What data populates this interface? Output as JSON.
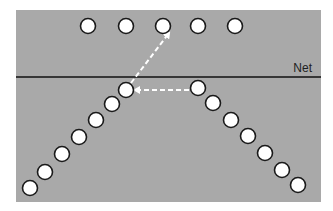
{
  "diagram": {
    "net_label": "Net",
    "colors": {
      "court": "#a9a9a9",
      "background": "#ffffff",
      "net_line": "#111111",
      "player_fill": "#ffffff",
      "player_stroke": "#1a1a1a",
      "arrow": "#ffffff"
    },
    "court": {
      "x": 16,
      "y": 10,
      "width": 305,
      "height": 192
    },
    "net": {
      "y": 77,
      "x1": 16,
      "x2": 321
    },
    "player_radius": 7.5,
    "players": {
      "far_side_row": [
        {
          "x": 88,
          "y": 26
        },
        {
          "x": 126,
          "y": 26
        },
        {
          "x": 163,
          "y": 26
        },
        {
          "x": 198,
          "y": 26
        },
        {
          "x": 235,
          "y": 26
        }
      ],
      "left_diagonal": [
        {
          "x": 126,
          "y": 90
        },
        {
          "x": 112,
          "y": 104
        },
        {
          "x": 96,
          "y": 120
        },
        {
          "x": 79,
          "y": 137
        },
        {
          "x": 62,
          "y": 154
        },
        {
          "x": 45,
          "y": 172
        },
        {
          "x": 30,
          "y": 188
        }
      ],
      "right_diagonal": [
        {
          "x": 198,
          "y": 88
        },
        {
          "x": 213,
          "y": 103
        },
        {
          "x": 231,
          "y": 120
        },
        {
          "x": 248,
          "y": 136
        },
        {
          "x": 265,
          "y": 153
        },
        {
          "x": 282,
          "y": 170
        },
        {
          "x": 298,
          "y": 185
        }
      ]
    },
    "arrows": [
      {
        "name": "pass-arrow",
        "from": {
          "x": 189,
          "y": 90
        },
        "to": {
          "x": 135,
          "y": 90
        }
      },
      {
        "name": "attack-arrow",
        "from": {
          "x": 131,
          "y": 83
        },
        "to": {
          "x": 169,
          "y": 33
        }
      }
    ]
  }
}
